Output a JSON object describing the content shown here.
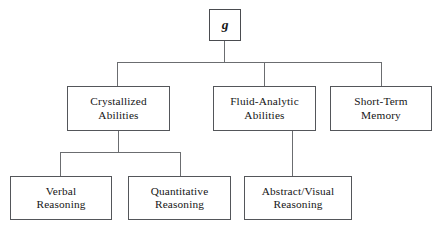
{
  "diagram": {
    "type": "hierarchical-tree",
    "orientation": "top-down",
    "levels": 3,
    "colors": {
      "background": "#ffffff",
      "box_border": "#54565a",
      "connector": "#6b6d70",
      "text": "#161616"
    },
    "nodes": {
      "root": {
        "id": "g",
        "label": "g",
        "style": "italic-bold-serif",
        "level": 1
      },
      "level2": [
        {
          "id": "crystallized",
          "line1": "Crystallized",
          "line2": "Abilities",
          "level": 2
        },
        {
          "id": "fluid-analytic",
          "line1": "Fluid-Analytic",
          "line2": "Abilities",
          "level": 2
        },
        {
          "id": "short-term-memory",
          "line1": "Short-Term",
          "line2": "Memory",
          "level": 2
        }
      ],
      "level3": [
        {
          "id": "verbal-reasoning",
          "line1": "Verbal",
          "line2": "Reasoning",
          "level": 3,
          "parent": "crystallized"
        },
        {
          "id": "quantitative-reasoning",
          "line1": "Quantitative",
          "line2": "Reasoning",
          "level": 3,
          "parent": "crystallized"
        },
        {
          "id": "abstract-visual-reasoning",
          "line1": "Abstract/Visual",
          "line2": "Reasoning",
          "level": 3,
          "parent": "fluid-analytic"
        }
      ]
    },
    "edges": [
      {
        "from": "g",
        "to": "crystallized"
      },
      {
        "from": "g",
        "to": "fluid-analytic"
      },
      {
        "from": "g",
        "to": "short-term-memory"
      },
      {
        "from": "crystallized",
        "to": "verbal-reasoning"
      },
      {
        "from": "crystallized",
        "to": "quantitative-reasoning"
      },
      {
        "from": "fluid-analytic",
        "to": "abstract-visual-reasoning"
      }
    ]
  }
}
